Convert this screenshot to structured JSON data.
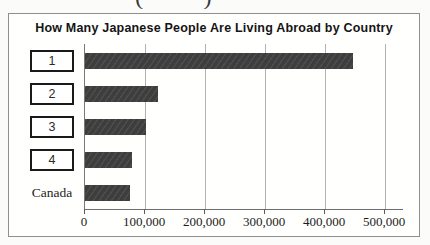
{
  "page": {
    "cropped_fragment": {
      "left_glyph": "(",
      "right_glyph": ")"
    }
  },
  "chart_data": {
    "type": "bar",
    "orientation": "horizontal",
    "title": "How Many Japanese People Are Living Abroad by Country",
    "categories": [
      "1",
      "2",
      "3",
      "4",
      "Canada"
    ],
    "values": [
      447000,
      121000,
      101000,
      78000,
      75000
    ],
    "boxed_categories": [
      true,
      true,
      true,
      true,
      false
    ],
    "xlim": [
      0,
      530000
    ],
    "xticks": [
      0,
      100000,
      200000,
      300000,
      400000,
      500000
    ],
    "xtick_labels": [
      "0",
      "100,000",
      "200,000",
      "300,000",
      "400,000",
      "500,000"
    ],
    "grid": "vertical",
    "legend": "none",
    "bar_color": "#3e3e3e",
    "gridline_color": "#b2b2b2",
    "axis_color": "#6e6e6e",
    "frame_border_color": "#8f8f8f",
    "category_box_border_color": "#1a1a1a"
  }
}
